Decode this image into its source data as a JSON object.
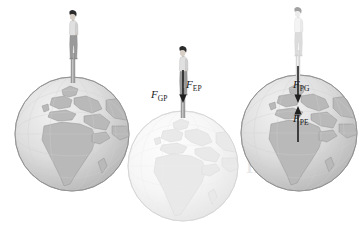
{
  "diagram": {
    "background_color": "#ffffff",
    "ink_color": "#1a1a1a"
  },
  "panels": [
    {
      "id": "panel-left",
      "name": "person-standing-on-earth",
      "globe": {
        "name": "earth-globe-left",
        "shade": "dark",
        "fill_land": "#b9b9b9",
        "fill_ocean": "#e2e2e2",
        "outline": "#8e8e8e",
        "visible_regions": "Africa, Europe, Middle East"
      },
      "person": {
        "name": "person-figure-left",
        "shade": "dark",
        "hair_color": "#2b2b2b",
        "shirt_color": "#dcdcdc",
        "trousers_color": "#9a9a9a"
      },
      "labels": []
    },
    {
      "id": "panel-middle",
      "name": "force-pair-gp-ep",
      "globe": {
        "name": "earth-globe-middle",
        "shade": "light",
        "fill_land": "#e6e6e6",
        "fill_ocean": "#f4f4f4",
        "outline": "#d2d2d2",
        "visible_regions": "Africa, Europe, Middle East"
      },
      "person": {
        "name": "person-figure-middle",
        "shade": "dark",
        "hair_color": "#2b2b2b",
        "shirt_color": "#dcdcdc",
        "trousers_color": "#9a9a9a"
      },
      "labels": [
        {
          "name": "force-label-gp",
          "symbol": "F",
          "subscript": "GP",
          "direction": "down"
        },
        {
          "name": "force-label-ep",
          "symbol": "F",
          "subscript": "EP",
          "direction": "down"
        }
      ]
    },
    {
      "id": "panel-right",
      "name": "force-pair-pg-pe",
      "globe": {
        "name": "earth-globe-right",
        "shade": "dark",
        "fill_land": "#b9b9b9",
        "fill_ocean": "#e2e2e2",
        "outline": "#8e8e8e",
        "visible_regions": "Africa, Europe, Middle East"
      },
      "person": {
        "name": "person-figure-right",
        "shade": "light",
        "hair_color": "#9f9f9f",
        "shirt_color": "#f2f2f2",
        "trousers_color": "#dcdcdc"
      },
      "labels": [
        {
          "name": "force-label-pg",
          "symbol": "F",
          "subscript": "PG",
          "direction": "down"
        },
        {
          "name": "force-label-pe",
          "symbol": "F",
          "subscript": "PE",
          "direction": "up"
        }
      ]
    }
  ],
  "watermark": {
    "name": "background-watermark",
    "text": "notes",
    "color": "#ececec"
  }
}
